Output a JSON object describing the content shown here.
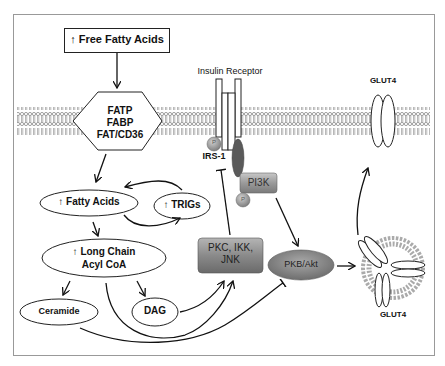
{
  "diagram": {
    "title_box": {
      "label": "↑ Free Fatty Acids"
    },
    "transporter": {
      "lines": [
        "FATP",
        "FABP",
        "FAT/CD36"
      ]
    },
    "insulin_receptor": {
      "label": "Insulin Receptor"
    },
    "irs1": {
      "label": "IRS-1",
      "phospho": "P"
    },
    "pi3k": {
      "label": "PI3K",
      "phospho": "P"
    },
    "glut4_membrane": {
      "label": "GLUT4"
    },
    "glut4_vesicle": {
      "label": "GLUT4"
    },
    "nodes": {
      "fatty_acids": "↑ Fatty Acids",
      "trigs": "↑ TRIGs",
      "long_chain_line1": "↑ Long Chain",
      "long_chain_line2": "Acyl CoA",
      "ceramide": "Ceramide",
      "dag": "DAG",
      "pkc_line1": "PKC, IKK,",
      "pkc_line2": "JNK",
      "pkb": "PKB/Akt"
    },
    "colors": {
      "kinase_box": "#8a8a8a",
      "pkb_ellipse": "#8f8f8f",
      "membrane": "#9a9a9a",
      "line": "#111111"
    }
  }
}
